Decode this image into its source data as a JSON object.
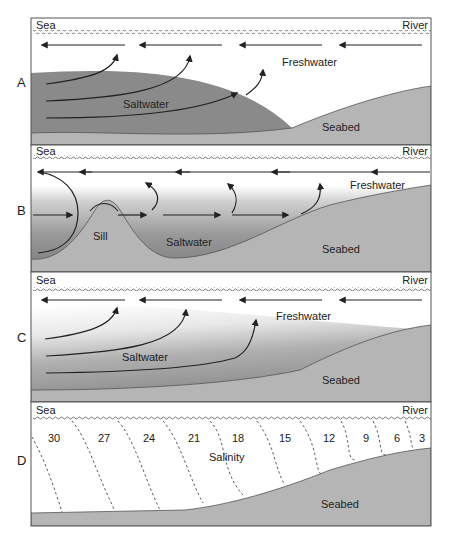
{
  "figure": {
    "type": "estuary-classification-diagram",
    "panels": [
      {
        "id": "A",
        "letter": "A",
        "left_label": "Sea",
        "right_label": "River",
        "labels": {
          "upper": "Freshwater",
          "lower": "Saltwater",
          "bed": "Seabed"
        }
      },
      {
        "id": "B",
        "letter": "B",
        "left_label": "Sea",
        "right_label": "River",
        "labels": {
          "upper": "Freshwater",
          "lower": "Saltwater",
          "bed": "Seabed",
          "sill": "Sill"
        }
      },
      {
        "id": "C",
        "letter": "C",
        "left_label": "Sea",
        "right_label": "River",
        "labels": {
          "upper": "Freshwater",
          "lower": "Saltwater",
          "bed": "Seabed"
        }
      },
      {
        "id": "D",
        "letter": "D",
        "left_label": "Sea",
        "right_label": "River",
        "labels": {
          "center": "Salinity",
          "bed": "Seabed"
        },
        "salinity_values": [
          "30",
          "27",
          "24",
          "21",
          "18",
          "15",
          "12",
          "9",
          "6",
          "3"
        ]
      }
    ],
    "colors": {
      "seabed": "#b4b4b4",
      "saltwater": "#8c8c8c",
      "border": "#555555",
      "arrow": "#222222"
    }
  }
}
